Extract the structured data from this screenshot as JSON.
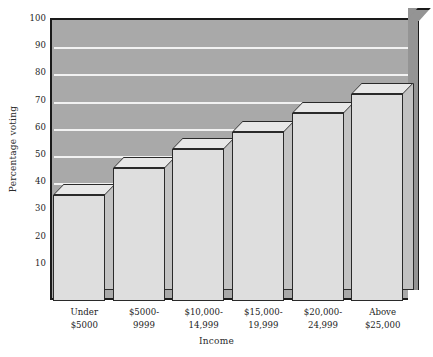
{
  "chart_data": {
    "type": "bar",
    "title": "",
    "xlabel": "Income",
    "ylabel": "Percentage voting",
    "categories": [
      "Under $5000",
      "$5000-9999",
      "$10,000-14,999",
      "$15,000-19,999",
      "$20,000-24,999",
      "Above $25,000"
    ],
    "category_lines": [
      [
        "Under",
        "$5000"
      ],
      [
        "$5000-",
        "9999"
      ],
      [
        "$10,000-",
        "14,999"
      ],
      [
        "$15,000-",
        "19,999"
      ],
      [
        "$20,000-",
        "24,999"
      ],
      [
        "Above",
        "$25,000"
      ]
    ],
    "values": [
      35,
      45,
      52,
      58,
      65,
      72
    ],
    "ylim": [
      0,
      100
    ],
    "yticks": [
      10,
      20,
      30,
      40,
      50,
      60,
      70,
      80,
      90,
      100
    ],
    "ytick_labels": [
      "10",
      "20",
      "30",
      "40",
      "50",
      "60",
      "70",
      "80",
      "90",
      "100"
    ],
    "grid": true,
    "legend": "none",
    "style": "3d-bar",
    "colors": {
      "panel_background": "#a9a9a9",
      "panel_wall": "#949494",
      "gridline": "#f2f2f2",
      "bar_face": "#dedede",
      "bar_side": "#c2c2c2",
      "bar_top": "#e8e8e8",
      "outline": "#2a2a2a",
      "text": "#1d1d1d",
      "page_background": "#ffffff"
    }
  }
}
